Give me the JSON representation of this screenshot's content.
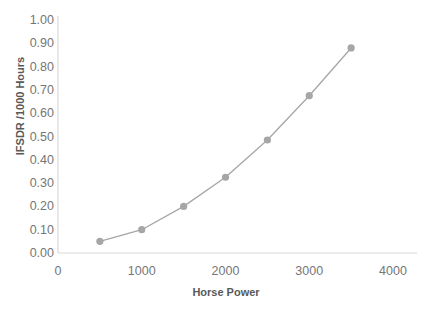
{
  "chart_data": {
    "type": "line",
    "title": "IFSDR vs Horse Power",
    "xlabel": "Horse Power",
    "ylabel": "IFSDR /1000 Hours",
    "xlim": [
      0,
      4000
    ],
    "ylim": [
      0.0,
      1.0
    ],
    "x_ticks": [
      0,
      1000,
      2000,
      3000,
      4000
    ],
    "x_tick_labels": [
      "0",
      "1000",
      "2000",
      "3000",
      "4000"
    ],
    "y_ticks": [
      0.0,
      0.1,
      0.2,
      0.3,
      0.4,
      0.5,
      0.6,
      0.7,
      0.8,
      0.9,
      1.0
    ],
    "y_tick_labels": [
      "0.00",
      "0.10",
      "0.20",
      "0.30",
      "0.40",
      "0.50",
      "0.60",
      "0.70",
      "0.80",
      "0.90",
      "1.00"
    ],
    "grid": false,
    "legend": false,
    "legend_position": "none",
    "marker": "circle",
    "series_color": "#a6a6a6",
    "axis_color": "#d9d9d9",
    "x": [
      500,
      1000,
      1500,
      2000,
      2500,
      3000,
      3500
    ],
    "values": [
      0.05,
      0.1,
      0.2,
      0.325,
      0.485,
      0.675,
      0.88
    ],
    "points": [
      {
        "x": 500,
        "y": 0.05
      },
      {
        "x": 1000,
        "y": 0.1
      },
      {
        "x": 1500,
        "y": 0.2
      },
      {
        "x": 2000,
        "y": 0.325
      },
      {
        "x": 2500,
        "y": 0.485
      },
      {
        "x": 3000,
        "y": 0.675
      },
      {
        "x": 3500,
        "y": 0.88
      }
    ]
  }
}
